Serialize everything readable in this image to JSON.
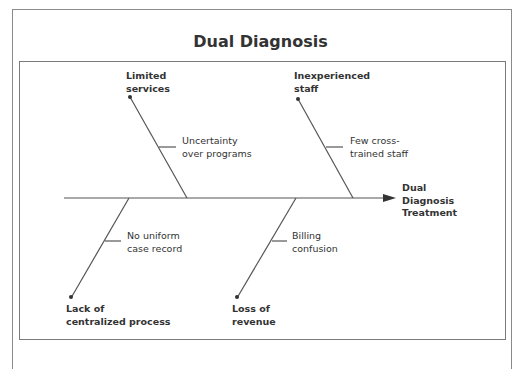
{
  "title": "Dual Diagnosis",
  "effect": {
    "line1": "Dual",
    "line2": "Diagnosis",
    "line3": "Treatment"
  },
  "categories": [
    {
      "id": "limited-services",
      "line1": "Limited",
      "line2": "services",
      "cause_line1": "Uncertainty",
      "cause_line2": "over programs"
    },
    {
      "id": "inexperienced-staff",
      "line1": "Inexperienced",
      "line2": "staff",
      "cause_line1": "Few cross-",
      "cause_line2": "trained staff"
    },
    {
      "id": "lack-of-centralized-process",
      "line1": "Lack of",
      "line2": "centralized process",
      "cause_line1": "No uniform",
      "cause_line2": "case record"
    },
    {
      "id": "loss-of-revenue",
      "line1": "Loss of",
      "line2": "revenue",
      "cause_line1": "Billing",
      "cause_line2": "confusion"
    }
  ],
  "colors": {
    "line": "#555555",
    "frame": "#8a8a8a",
    "text": "#333333"
  }
}
